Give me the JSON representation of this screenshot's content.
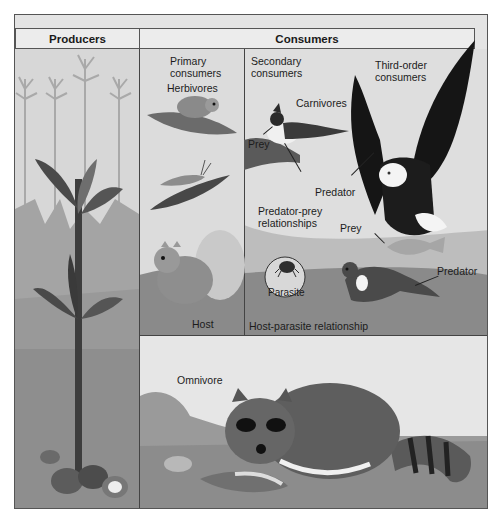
{
  "diagram": {
    "header": {
      "producers": "Producers",
      "consumers": "Consumers"
    },
    "columns": {
      "primary": {
        "line1": "Primary",
        "line2": "consumers",
        "group": "Herbivores"
      },
      "secondary": {
        "line1": "Secondary",
        "line2": "consumers",
        "group": "Carnivores"
      },
      "third": {
        "line1": "Third-order",
        "line2": "consumers"
      }
    },
    "labels": {
      "prey_bird": "Prey",
      "predator_bird": "Predator",
      "predator_prey_line1": "Predator-prey",
      "predator_prey_line2": "relationships",
      "prey_fish": "Prey",
      "predator_otter": "Predator",
      "parasite": "Parasite",
      "host": "Host",
      "host_parasite": "Host-parasite relationship",
      "omnivore": "Omnivore"
    },
    "organisms": {
      "producers": [
        "corn plants",
        "nuts"
      ],
      "primary": [
        "mouse",
        "grasshopper",
        "squirrel"
      ],
      "secondary": [
        "blue jay",
        "tick",
        "otter"
      ],
      "third": [
        "eagle"
      ],
      "omnivore": [
        "raccoon",
        "opossum",
        "corn cob"
      ]
    },
    "colors": {
      "panel_bg": "#e4e4e4",
      "border": "#555555",
      "ground": "#8f8f8f",
      "dark_animal": "#1a1a1a"
    }
  }
}
